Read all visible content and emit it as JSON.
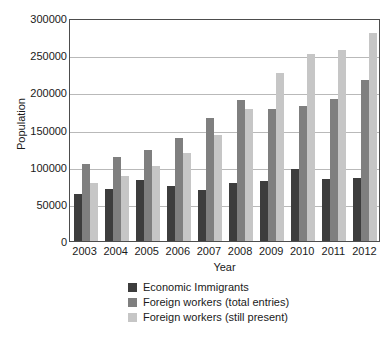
{
  "chart_data": {
    "type": "bar",
    "title": "",
    "xlabel": "Year",
    "ylabel": "Population",
    "categories": [
      "2003",
      "2004",
      "2005",
      "2006",
      "2007",
      "2008",
      "2009",
      "2010",
      "2011",
      "2012"
    ],
    "ylim": [
      0,
      300000
    ],
    "yticks": [
      0,
      50000,
      100000,
      150000,
      200000,
      250000,
      300000
    ],
    "ytick_labels": [
      "0",
      "50000",
      "100000",
      "150000",
      "200000",
      "250000",
      "300000"
    ],
    "grid": true,
    "legend_position": "bottom-center",
    "series": [
      {
        "name": "Economic Immigrants",
        "color": "#3d3d3d",
        "values": [
          63000,
          70000,
          82000,
          74000,
          69000,
          78000,
          81000,
          97000,
          83000,
          85000
        ]
      },
      {
        "name": "Foreign workers (total entries)",
        "color": "#7f7f7f",
        "values": [
          103000,
          113000,
          123000,
          139000,
          165000,
          190000,
          178000,
          181000,
          191000,
          216000
        ]
      },
      {
        "name": "Foreign workers (still present)",
        "color": "#c6c6c6",
        "values": [
          78000,
          88000,
          101000,
          118000,
          143000,
          178000,
          226000,
          252000,
          257000,
          280000
        ]
      }
    ]
  }
}
